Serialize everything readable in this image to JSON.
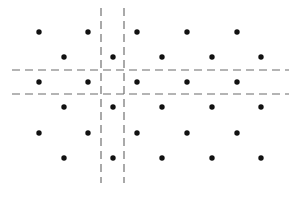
{
  "figure": {
    "width": 297,
    "height": 199,
    "background_color": "#ffffff"
  },
  "chart_data": {
    "type": "scatter",
    "title": "",
    "subtitle": "",
    "xlabel": "",
    "ylabel": "",
    "xlim": [
      0,
      297
    ],
    "ylim": [
      0,
      199
    ],
    "grid": true,
    "legend": null,
    "annotations": [],
    "point_style": {
      "marker": "circle",
      "color": "#111111",
      "radius": 2.7,
      "count": 30
    },
    "rows": [
      {
        "index": 0,
        "y": 32,
        "offset": "even",
        "x_values": [
          39,
          88,
          137,
          187,
          237
        ]
      },
      {
        "index": 1,
        "y": 57,
        "offset": "odd",
        "x_values": [
          64,
          113,
          162,
          212,
          261
        ]
      },
      {
        "index": 2,
        "y": 82,
        "offset": "even",
        "x_values": [
          39,
          88,
          137,
          187,
          237
        ]
      },
      {
        "index": 3,
        "y": 107,
        "offset": "odd",
        "x_values": [
          64,
          113,
          162,
          212,
          261
        ]
      },
      {
        "index": 4,
        "y": 133,
        "offset": "even",
        "x_values": [
          39,
          88,
          137,
          187,
          237
        ]
      },
      {
        "index": 5,
        "y": 158,
        "offset": "odd",
        "x_values": [
          64,
          113,
          162,
          212,
          261
        ]
      }
    ],
    "points": [
      {
        "x": 39,
        "y": 32
      },
      {
        "x": 88,
        "y": 32
      },
      {
        "x": 137,
        "y": 32
      },
      {
        "x": 187,
        "y": 32
      },
      {
        "x": 237,
        "y": 32
      },
      {
        "x": 64,
        "y": 57
      },
      {
        "x": 113,
        "y": 57
      },
      {
        "x": 162,
        "y": 57
      },
      {
        "x": 212,
        "y": 57
      },
      {
        "x": 261,
        "y": 57
      },
      {
        "x": 39,
        "y": 82
      },
      {
        "x": 88,
        "y": 82
      },
      {
        "x": 137,
        "y": 82
      },
      {
        "x": 187,
        "y": 82
      },
      {
        "x": 237,
        "y": 82
      },
      {
        "x": 64,
        "y": 107
      },
      {
        "x": 113,
        "y": 107
      },
      {
        "x": 162,
        "y": 107
      },
      {
        "x": 212,
        "y": 107
      },
      {
        "x": 261,
        "y": 107
      },
      {
        "x": 39,
        "y": 133
      },
      {
        "x": 88,
        "y": 133
      },
      {
        "x": 137,
        "y": 133
      },
      {
        "x": 187,
        "y": 133
      },
      {
        "x": 237,
        "y": 133
      },
      {
        "x": 64,
        "y": 158
      },
      {
        "x": 113,
        "y": 158
      },
      {
        "x": 162,
        "y": 158
      },
      {
        "x": 212,
        "y": 158
      },
      {
        "x": 261,
        "y": 158
      }
    ],
    "grid_lines": {
      "color": "#6b6b6b",
      "style": "dashed",
      "dash_pattern": "8 5",
      "width": 1.15,
      "vertical": [
        {
          "x": 101,
          "y_start": 8,
          "y_end": 183
        },
        {
          "x": 124,
          "y_start": 8,
          "y_end": 183
        }
      ],
      "horizontal": [
        {
          "y": 70,
          "x_start": 12,
          "x_end": 289
        },
        {
          "y": 94,
          "x_start": 12,
          "x_end": 289
        }
      ]
    }
  }
}
